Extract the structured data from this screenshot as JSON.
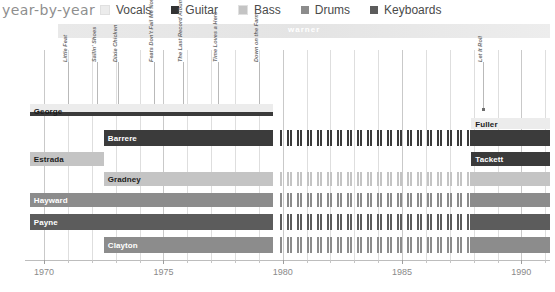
{
  "header": {
    "title": "year-by-year",
    "legend": [
      {
        "label": "Vocals",
        "color": "#ececec"
      },
      {
        "label": "Guitar",
        "color": "#333333"
      },
      {
        "label": "Bass",
        "color": "#c4c4c4"
      },
      {
        "label": "Drums",
        "color": "#8c8c8c"
      },
      {
        "label": "Keyboards",
        "color": "#5c5c5c"
      }
    ]
  },
  "era": {
    "label": "warner",
    "start": 1970.6,
    "end": 1991.2
  },
  "albums": [
    {
      "title": "Little Feat",
      "year": 1971.0
    },
    {
      "title": "Sailin' Shoes",
      "year": 1972.2
    },
    {
      "title": "Dixie Chicken",
      "year": 1973.1
    },
    {
      "title": "Feats Don't Fail Me Now",
      "year": 1974.6
    },
    {
      "title": "The Last Record Album",
      "year": 1975.8
    },
    {
      "title": "Time Loves a Hero",
      "year": 1977.3
    },
    {
      "title": "Down on the Farm",
      "year": 1979.0
    },
    {
      "title": "Let It Roll",
      "year": 1988.4
    }
  ],
  "axis": {
    "min": 1969.2,
    "max": 1991.2,
    "ticks": [
      1970,
      1975,
      1980,
      1985,
      1990
    ],
    "tick_labels": [
      "1970",
      "1975",
      "1980",
      "1985",
      "1990"
    ],
    "minor_step": 1
  },
  "chart_data": {
    "type": "bar",
    "title": "year-by-year",
    "xlabel": "",
    "ylabel": "",
    "xlim": [
      1969.2,
      1991.2
    ],
    "grid": true,
    "legend_position": "top",
    "categories": [
      "George",
      "Barrere",
      "Estrada",
      "Gradney",
      "Hayward",
      "Payne",
      "Clayton"
    ],
    "series": [
      {
        "name": "Vocals",
        "color": "#ececec"
      },
      {
        "name": "Guitar",
        "color": "#333333"
      },
      {
        "name": "Bass",
        "color": "#c4c4c4"
      },
      {
        "name": "Drums",
        "color": "#8c8c8c"
      },
      {
        "name": "Keyboards",
        "color": "#5c5c5c"
      }
    ],
    "rows": [
      {
        "name": "George",
        "label_align": "left",
        "label_tone": "light",
        "top": 0,
        "height": 14,
        "bars": [
          {
            "role": "Vocals",
            "color": "#ececec",
            "start": 1969.4,
            "end": 1979.6,
            "style": "solid",
            "top": 0,
            "height": 11
          },
          {
            "role": "Guitar",
            "color": "#3b3b3b",
            "start": 1969.4,
            "end": 1979.6,
            "style": "solid",
            "top": 8,
            "height": 4
          }
        ]
      },
      {
        "name": "Barrere",
        "label_align": "left",
        "label_tone": "dark",
        "top": 26,
        "height": 16,
        "bars": [
          {
            "role": "Guitar",
            "color": "#3b3b3b",
            "start": 1972.5,
            "end": 1979.6,
            "style": "solid",
            "top": 0,
            "height": 16
          },
          {
            "role": "Guitar",
            "color": "#3b3b3b",
            "start": 1979.9,
            "end": 1987.9,
            "style": "dashed",
            "top": 0,
            "height": 16
          },
          {
            "role": "Guitar",
            "color": "#3b3b3b",
            "start": 1987.9,
            "end": 1991.2,
            "style": "solid",
            "top": 0,
            "height": 16
          }
        ]
      },
      {
        "name": "Estrada",
        "label_align": "left",
        "label_tone": "light",
        "top": 48,
        "height": 14,
        "bars": [
          {
            "role": "Bass",
            "color": "#c4c4c4",
            "start": 1969.4,
            "end": 1972.5,
            "style": "solid",
            "top": 0,
            "height": 14
          }
        ]
      },
      {
        "name": "Gradney",
        "label_align": "left",
        "label_tone": "light",
        "top": 68,
        "height": 14,
        "bars": [
          {
            "role": "Bass",
            "color": "#c4c4c4",
            "start": 1972.5,
            "end": 1979.6,
            "style": "solid",
            "top": 0,
            "height": 14
          },
          {
            "role": "Bass",
            "color": "#c4c4c4",
            "start": 1979.9,
            "end": 1987.9,
            "style": "dashed",
            "top": 0,
            "height": 14
          },
          {
            "role": "Bass",
            "color": "#c4c4c4",
            "start": 1987.9,
            "end": 1991.2,
            "style": "solid",
            "top": 0,
            "height": 14
          }
        ]
      },
      {
        "name": "Hayward",
        "label_align": "left",
        "label_tone": "dark",
        "top": 89,
        "height": 14,
        "bars": [
          {
            "role": "Drums",
            "color": "#8c8c8c",
            "start": 1969.4,
            "end": 1979.6,
            "style": "solid",
            "top": 0,
            "height": 14
          },
          {
            "role": "Drums",
            "color": "#8c8c8c",
            "start": 1979.9,
            "end": 1987.9,
            "style": "dashed",
            "top": 0,
            "height": 14
          },
          {
            "role": "Drums",
            "color": "#8c8c8c",
            "start": 1987.9,
            "end": 1991.2,
            "style": "solid",
            "top": 0,
            "height": 14
          }
        ]
      },
      {
        "name": "Payne",
        "label_align": "left",
        "label_tone": "dark",
        "top": 110,
        "height": 16,
        "bars": [
          {
            "role": "Keyboards",
            "color": "#5c5c5c",
            "start": 1969.4,
            "end": 1979.6,
            "style": "solid",
            "top": 0,
            "height": 16
          },
          {
            "role": "Keyboards",
            "color": "#5c5c5c",
            "start": 1979.9,
            "end": 1987.9,
            "style": "dashed",
            "top": 0,
            "height": 16
          },
          {
            "role": "Keyboards",
            "color": "#5c5c5c",
            "start": 1987.9,
            "end": 1991.2,
            "style": "solid",
            "top": 0,
            "height": 16
          }
        ]
      },
      {
        "name": "Clayton",
        "label_align": "left",
        "label_tone": "dark",
        "top": 133,
        "height": 16,
        "bars": [
          {
            "role": "Drums",
            "color": "#8c8c8c",
            "start": 1972.5,
            "end": 1979.6,
            "style": "solid",
            "top": 0,
            "height": 16
          },
          {
            "role": "Drums",
            "color": "#8c8c8c",
            "start": 1979.9,
            "end": 1987.9,
            "style": "dashed",
            "top": 0,
            "height": 16
          },
          {
            "role": "Drums",
            "color": "#8c8c8c",
            "start": 1987.9,
            "end": 1991.2,
            "style": "solid",
            "top": 0,
            "height": 16
          }
        ]
      }
    ],
    "right_labels": [
      {
        "name": "Fuller",
        "role": "Vocals",
        "color": "#ececec",
        "start": 1987.9,
        "end": 1991.2,
        "top": 14,
        "height": 11,
        "label_tone": "light"
      },
      {
        "name": "Tackett",
        "role": "Guitar",
        "color": "#3b3b3b",
        "start": 1987.9,
        "end": 1991.2,
        "top": 48,
        "height": 14,
        "label_tone": "dark"
      }
    ]
  }
}
